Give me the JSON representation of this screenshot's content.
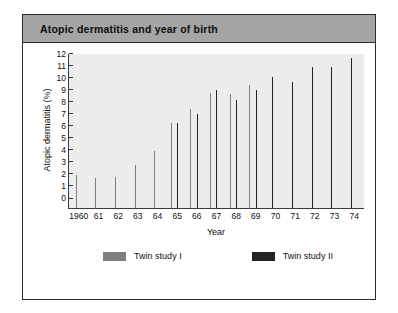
{
  "card": {
    "title": "Atopic dermatitis and year of birth"
  },
  "chart_data": {
    "type": "bar",
    "title": "Atopic dermatitis and year of birth",
    "xlabel": "Year",
    "ylabel": "Atopic dermatitis (%)",
    "ylim": [
      0,
      12.8
    ],
    "yticks": [
      0,
      1,
      2,
      3,
      4,
      5,
      6,
      7,
      8,
      9,
      10,
      11,
      12
    ],
    "grid": false,
    "legend_position": "bottom",
    "categories": [
      "1960",
      "61",
      "62",
      "63",
      "64",
      "65",
      "66",
      "67",
      "68",
      "69",
      "70",
      "71",
      "72",
      "73",
      "74"
    ],
    "series": [
      {
        "name": "Twin study I",
        "color": "#7e7e7e",
        "values": [
          2.75,
          2.5,
          2.55,
          3.6,
          4.7,
          7.1,
          8.2,
          9.6,
          9.5,
          10.2,
          null,
          null,
          null,
          null,
          null
        ]
      },
      {
        "name": "Twin study II",
        "color": "#242424",
        "values": [
          null,
          null,
          null,
          null,
          null,
          7.1,
          7.8,
          9.8,
          9.0,
          9.8,
          10.9,
          10.5,
          11.7,
          11.7,
          12.5
        ]
      }
    ]
  }
}
